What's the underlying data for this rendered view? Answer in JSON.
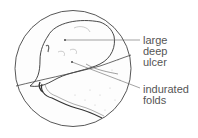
{
  "figure": {
    "type": "endoscopic view illustration",
    "labels": [
      {
        "id": "ulcer",
        "lines": [
          "large",
          "deep",
          "ulcer"
        ]
      },
      {
        "id": "folds",
        "lines": [
          "indurated",
          "folds"
        ]
      }
    ],
    "colors": {
      "line": "#333333",
      "label_text": "#555555",
      "leader": "#666666",
      "shading": "#bbbbbb"
    }
  }
}
